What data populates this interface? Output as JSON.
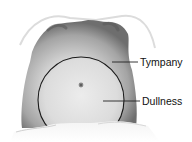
{
  "figure": {
    "labels": [
      {
        "id": "tympany",
        "text": "Tympany"
      },
      {
        "id": "dullness",
        "text": "Dullness"
      }
    ],
    "colors": {
      "background": "#ffffff",
      "skin_dark": "#7a7a7a",
      "skin_mid": "#b8b8b8",
      "skin_light": "#e4e4e4",
      "outline": "#1a1a1a",
      "leader_line": "#222222"
    }
  }
}
